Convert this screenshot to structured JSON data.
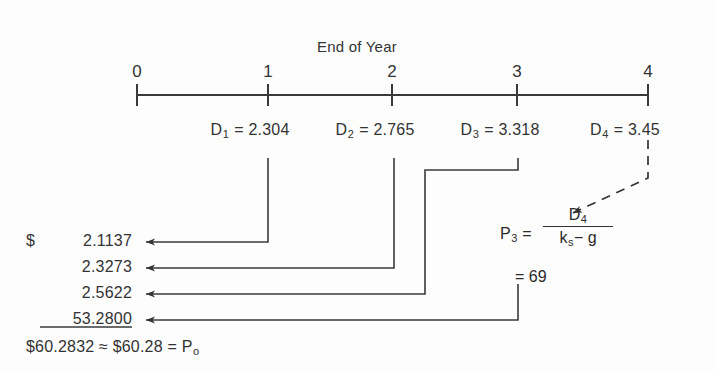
{
  "diagram": {
    "title": "End of Year",
    "type": "timeline-cash-flow",
    "axis": {
      "tick_labels": [
        "0",
        "1",
        "2",
        "3",
        "4"
      ],
      "tick_x": [
        137,
        268,
        392,
        517,
        648
      ],
      "line_y": 95
    },
    "dividends": [
      {
        "label": "D",
        "subscript": "1",
        "eq": "=",
        "value": "2.304",
        "year": 1,
        "x": 268
      },
      {
        "label": "D",
        "subscript": "2",
        "eq": "=",
        "value": "2.765",
        "year": 2,
        "x": 392
      },
      {
        "label": "D",
        "subscript": "3",
        "eq": "=",
        "value": "3.318",
        "year": 3,
        "x": 517
      },
      {
        "label": "D",
        "subscript": "4",
        "eq": "=",
        "value": "3.45",
        "year": 4,
        "x": 648
      }
    ],
    "present_values": [
      {
        "currency": "$",
        "value": "2.1137",
        "source": "D1"
      },
      {
        "currency": "",
        "value": "2.3273",
        "source": "D2"
      },
      {
        "currency": "",
        "value": "2.5622",
        "source": "D3"
      },
      {
        "currency": "",
        "value": "53.2800",
        "source": "P3"
      }
    ],
    "total": {
      "sum": "$60.2832",
      "approx_symbol": "≈",
      "rounded": "$60.28",
      "equals": "=",
      "result_label": "P",
      "result_subscript": "o"
    },
    "terminal_value": {
      "label": "P",
      "subscript": "3",
      "equals": "=",
      "numerator_label": "D",
      "numerator_subscript": "4",
      "denominator": "k",
      "denominator_subscript": "s",
      "denominator_rest": "− g",
      "result_equals": "=",
      "result": "69"
    },
    "colors": {
      "ink": "#333333",
      "background": "#fdfdfd",
      "line": "#3a3a3a"
    }
  }
}
